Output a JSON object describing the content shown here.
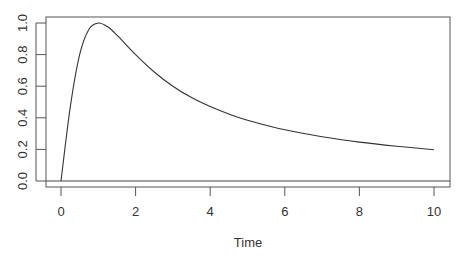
{
  "chart_data": {
    "type": "line",
    "title": "",
    "xlabel": "Time",
    "ylabel": "",
    "xlim": [
      -0.4,
      10.4
    ],
    "ylim": [
      -0.04,
      1.04
    ],
    "xticks": [
      0,
      2,
      4,
      6,
      8,
      10
    ],
    "xtick_labels": [
      "0",
      "2",
      "4",
      "6",
      "8",
      "10"
    ],
    "yticks": [
      0.0,
      0.2,
      0.4,
      0.6,
      0.8,
      1.0
    ],
    "ytick_labels": [
      "0.0",
      "0.2",
      "0.4",
      "0.6",
      "0.8",
      "1.0"
    ],
    "grid": false,
    "legend": null,
    "reference_lines": [
      {
        "orientation": "horizontal",
        "y": 0
      }
    ],
    "series": [
      {
        "name": "response",
        "color": "#333333",
        "x": [
          0,
          0.25,
          0.5,
          0.75,
          1,
          1.25,
          1.5,
          2,
          2.5,
          3,
          3.5,
          4,
          4.5,
          5,
          6,
          7,
          8,
          9,
          10
        ],
        "y": [
          0,
          0.471,
          0.8,
          0.96,
          1.0,
          0.976,
          0.923,
          0.8,
          0.69,
          0.6,
          0.528,
          0.471,
          0.424,
          0.385,
          0.324,
          0.28,
          0.246,
          0.22,
          0.198
        ]
      }
    ]
  },
  "axis": {
    "xlabel": "Time"
  }
}
